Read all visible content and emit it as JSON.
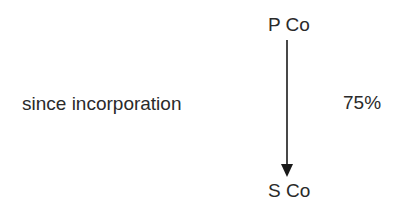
{
  "diagram": {
    "parent": {
      "label": "P Co"
    },
    "subsidiary": {
      "label": "S Co"
    },
    "relationship": {
      "direction": "parent-to-subsidiary",
      "ownership": "75%",
      "note": "since incorporation"
    }
  }
}
